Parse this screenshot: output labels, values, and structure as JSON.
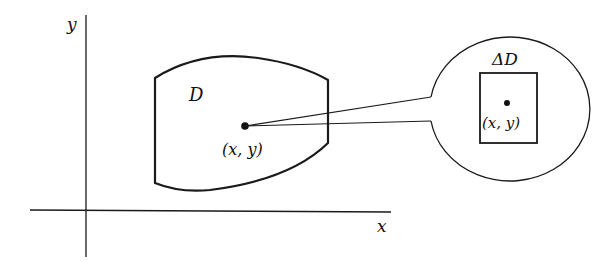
{
  "figure": {
    "axes": {
      "x_label": "x",
      "y_label": "y"
    },
    "region": {
      "label": "D"
    },
    "point": {
      "label": "(x, y)"
    },
    "magnified": {
      "label": "ΔD",
      "point_label": "(x, y)"
    },
    "colors": {
      "stroke": "#1a1a1a",
      "background": "#ffffff"
    }
  }
}
